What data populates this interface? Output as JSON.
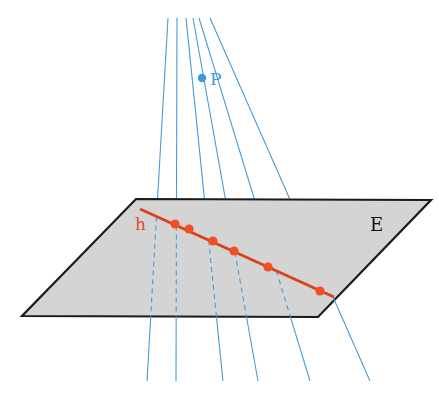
{
  "diagram": {
    "labels": {
      "point": "P",
      "line": "h",
      "plane": "E"
    },
    "colors": {
      "rays": "#4a9ad8",
      "point_p": "#3b9be0",
      "line_h": "#d9421c",
      "intersections": "#f04e23",
      "plane_fill": "#d4d4d4",
      "plane_edge": "#1a1a1a",
      "label_p": "#3b9be0",
      "label_h": "#e0502a",
      "label_e": "#111111"
    },
    "point_p": {
      "x": 202,
      "y": 78
    },
    "plane_corners": [
      [
        136,
        199
      ],
      [
        431,
        200
      ],
      [
        318,
        317
      ],
      [
        22,
        316
      ]
    ],
    "line_h": {
      "start": [
        140,
        209
      ],
      "end": [
        334,
        297
      ]
    },
    "intersections": [
      [
        175,
        224
      ],
      [
        189,
        229
      ],
      [
        213,
        241
      ],
      [
        234,
        251
      ],
      [
        268,
        267
      ],
      [
        320,
        291
      ]
    ],
    "rays": [
      {
        "top": [
          168,
          18
        ],
        "bottom": [
          147,
          381
        ]
      },
      {
        "top": [
          177,
          18
        ],
        "bottom": [
          176,
          381
        ]
      },
      {
        "top": [
          186,
          18
        ],
        "bottom": [
          223,
          381
        ]
      },
      {
        "top": [
          193,
          18
        ],
        "bottom": [
          258,
          381
        ]
      },
      {
        "top": [
          199,
          18
        ],
        "bottom": [
          310,
          381
        ]
      },
      {
        "top": [
          210,
          18
        ],
        "bottom": [
          370,
          381
        ]
      }
    ]
  }
}
